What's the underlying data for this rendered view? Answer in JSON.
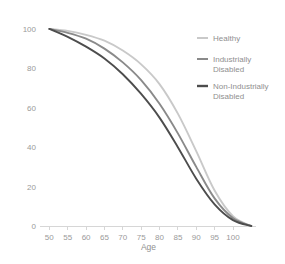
{
  "chart_data": {
    "type": "line",
    "title": "",
    "subtitle": "",
    "xlabel": "Age",
    "ylabel": "",
    "xlim": [
      48,
      106
    ],
    "ylim": [
      0,
      104
    ],
    "grid": false,
    "legend_position": "right",
    "x_ticks": [
      50,
      55,
      60,
      65,
      70,
      75,
      80,
      85,
      90,
      95,
      100
    ],
    "x_tick_labels": [
      "50",
      "55",
      "60",
      "65",
      "70",
      "75",
      "80",
      "85",
      "90",
      "95",
      "100"
    ],
    "y_ticks": [
      0,
      20,
      40,
      60,
      80,
      100
    ],
    "y_tick_labels": [
      "0",
      "20",
      "40",
      "60",
      "80",
      "100"
    ],
    "x": [
      50,
      55,
      60,
      65,
      70,
      75,
      80,
      85,
      90,
      95,
      100,
      105
    ],
    "series": [
      {
        "name": "Healthy",
        "color": "#c9c9c9",
        "values": [
          100,
          99,
          97,
          94,
          89,
          82,
          72,
          57,
          38,
          18,
          5,
          0
        ]
      },
      {
        "name": "Industrially Disabled",
        "color": "#8a8a8a",
        "values": [
          100,
          98,
          95,
          90,
          83,
          74,
          62,
          47,
          30,
          14,
          4,
          0
        ]
      },
      {
        "name": "Non-Industrially Disabled",
        "color": "#4d4d4d",
        "values": [
          100,
          96,
          91,
          85,
          77,
          67,
          55,
          40,
          24,
          11,
          3,
          0
        ]
      }
    ]
  },
  "legend": {
    "entries": [
      {
        "label": "Healthy",
        "label_line2": "",
        "color": "#c9c9c9"
      },
      {
        "label": "Industrially",
        "label_line2": "Disabled",
        "color": "#8a8a8a"
      },
      {
        "label": "Non-Industrially",
        "label_line2": "Disabled",
        "color": "#4d4d4d"
      }
    ]
  },
  "colors": {
    "background": "#ffffff",
    "axis": "#d6d6d6",
    "text": "#8f8f8f",
    "healthy": "#c9c9c9",
    "industrially_disabled": "#8a8a8a",
    "non_industrially_disabled": "#4d4d4d"
  }
}
